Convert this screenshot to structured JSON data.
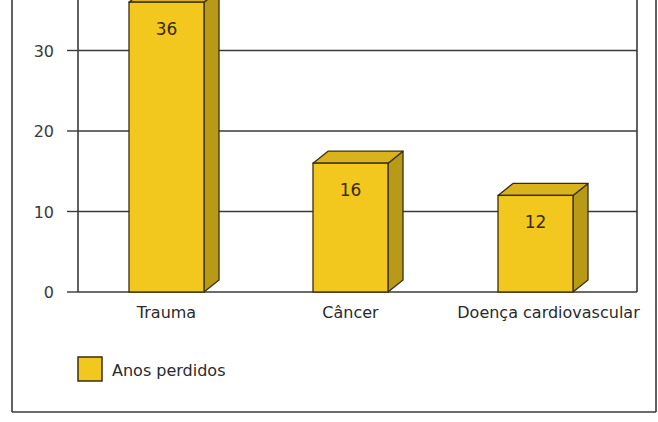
{
  "chart_data": {
    "type": "bar",
    "title": "",
    "xlabel": "",
    "ylabel": "",
    "categories": [
      "Trauma",
      "Câncer",
      "Doença cardiovascular"
    ],
    "series": [
      {
        "name": "Anos perdidos",
        "values": [
          36,
          16,
          12
        ],
        "color": "#f2c81f"
      }
    ],
    "ylim": [
      0,
      36
    ],
    "yticks": [
      0,
      10,
      20,
      30
    ],
    "grid": true,
    "legend_position": "bottom-left",
    "data_labels": [
      "36",
      "16",
      "12"
    ],
    "style": "3d-bar"
  },
  "colors": {
    "bar_front": "#f2c81f",
    "bar_top": "#d9b31c",
    "bar_side": "#b89a17",
    "outline": "#3a2e10",
    "grid": "#3a3a3a",
    "frame": "#3a3a3a"
  },
  "legend": {
    "label": "Anos perdidos"
  }
}
